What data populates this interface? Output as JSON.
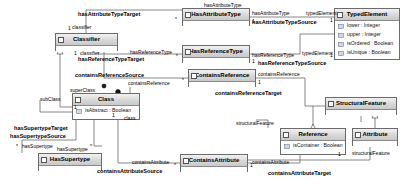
{
  "diagram": {
    "type": "uml-class-diagram",
    "background": "#ffffff",
    "node_header_color": "#d8d8d8",
    "node_border_color": "#6b6b6b"
  },
  "nodes": [
    {
      "id": "hasAttributeType",
      "name": "HasAttributeType",
      "attributes": [],
      "x": 182,
      "y": 8,
      "w": 68,
      "h": 18
    },
    {
      "id": "typedElement",
      "name": "TypedElement",
      "attributes": [
        "lower : Integer",
        "upper : Integer",
        "isOrdered : Boolean",
        "isUnique : Boolean"
      ],
      "x": 334,
      "y": 8,
      "w": 66,
      "h": 52
    },
    {
      "id": "classifier",
      "name": "Classifier",
      "attributes": [],
      "x": 55,
      "y": 33,
      "w": 63,
      "h": 18
    },
    {
      "id": "hasReferenceType",
      "name": "HasReferenceType",
      "attributes": [],
      "x": 182,
      "y": 45,
      "w": 68,
      "h": 18
    },
    {
      "id": "containsReference",
      "name": "ContainsReference",
      "attributes": [],
      "x": 188,
      "y": 69,
      "w": 68,
      "h": 18
    },
    {
      "id": "class",
      "name": "Class",
      "attributes": [
        "isAbstract : Boolean"
      ],
      "x": 72,
      "y": 93,
      "w": 68,
      "h": 27
    },
    {
      "id": "structuralFeature",
      "name": "StructuralFeature",
      "attributes": [],
      "x": 325,
      "y": 97,
      "w": 72,
      "h": 18
    },
    {
      "id": "reference",
      "name": "Reference",
      "attributes": [
        "isContainer : Boolean"
      ],
      "x": 280,
      "y": 128,
      "w": 66,
      "h": 27
    },
    {
      "id": "attribute",
      "name": "Attribute",
      "attributes": [],
      "x": 352,
      "y": 128,
      "w": 46,
      "h": 18
    },
    {
      "id": "containsAttribute",
      "name": "ContainsAttribute",
      "attributes": [],
      "x": 180,
      "y": 154,
      "w": 68,
      "h": 18
    },
    {
      "id": "hasSupertype",
      "name": "HasSupertype",
      "attributes": [],
      "x": 38,
      "y": 153,
      "w": 64,
      "h": 18
    }
  ],
  "edge_labels": [
    {
      "id": "l1",
      "text": "hasAttributeType",
      "style": "role",
      "x": 204,
      "y": 2
    },
    {
      "id": "l2",
      "text": "hasAttributeTypeTarget",
      "style": "edge",
      "x": 78,
      "y": 11
    },
    {
      "id": "l3",
      "text": "hasAttributeType",
      "style": "role",
      "x": 252,
      "y": 10
    },
    {
      "id": "l4",
      "text": "typedElement",
      "style": "role",
      "x": 306,
      "y": 10
    },
    {
      "id": "l5",
      "text": "hasAttributeTypeSource",
      "style": "edge",
      "x": 252,
      "y": 19
    },
    {
      "id": "l6",
      "text": "classifier",
      "style": "role",
      "x": 72,
      "y": 24
    },
    {
      "id": "l7",
      "text": "classifier",
      "style": "role",
      "x": 80,
      "y": 50
    },
    {
      "id": "l8",
      "text": "hasReferenceType",
      "style": "role",
      "x": 130,
      "y": 49
    },
    {
      "id": "l9",
      "text": "hasReferenceTypeTarget",
      "style": "edge",
      "x": 78,
      "y": 56
    },
    {
      "id": "l10",
      "text": "hasReferenceType",
      "style": "role",
      "x": 252,
      "y": 52
    },
    {
      "id": "l11",
      "text": "typedElement",
      "style": "role",
      "x": 302,
      "y": 50
    },
    {
      "id": "l12",
      "text": "hasReferenceTypeSource",
      "style": "edge",
      "x": 258,
      "y": 60
    },
    {
      "id": "l13",
      "text": "containsReferenceSource",
      "style": "edge",
      "x": 75,
      "y": 72
    },
    {
      "id": "l14",
      "text": "containsReference",
      "style": "role",
      "x": 128,
      "y": 80
    },
    {
      "id": "l15",
      "text": "containsReference",
      "style": "role",
      "x": 258,
      "y": 71
    },
    {
      "id": "l16",
      "text": "containsReferenceTarget",
      "style": "edge",
      "x": 215,
      "y": 90
    },
    {
      "id": "l17",
      "text": "superClass",
      "style": "role",
      "x": 70,
      "y": 87
    },
    {
      "id": "l18",
      "text": "subClass",
      "style": "role",
      "x": 40,
      "y": 96
    },
    {
      "id": "l19",
      "text": "class",
      "style": "role",
      "x": 124,
      "y": 115
    },
    {
      "id": "l20",
      "text": "hasSupertypeTarget",
      "style": "edge",
      "x": 14,
      "y": 125
    },
    {
      "id": "l21",
      "text": "hasSupertypeSource",
      "style": "edge",
      "x": 10,
      "y": 133
    },
    {
      "id": "l22",
      "text": "hasSupertype",
      "style": "role",
      "x": 22,
      "y": 143
    },
    {
      "id": "l23",
      "text": "hasSupertype",
      "style": "role",
      "x": 57,
      "y": 146
    },
    {
      "id": "l24",
      "text": "structuralFeature",
      "style": "role",
      "x": 236,
      "y": 120
    },
    {
      "id": "l25",
      "text": "structuralFeature",
      "style": "role",
      "x": 360,
      "y": 150
    },
    {
      "id": "l26",
      "text": "containsAttribute",
      "style": "role",
      "x": 132,
      "y": 159
    },
    {
      "id": "l27",
      "text": "containsAttributeSource",
      "style": "edge",
      "x": 97,
      "y": 168
    },
    {
      "id": "l28",
      "text": "containsAttribute",
      "style": "role",
      "x": 252,
      "y": 159
    },
    {
      "id": "l29",
      "text": "containsAttributeTarget",
      "style": "edge",
      "x": 272,
      "y": 170
    }
  ],
  "multiplicities": [
    {
      "id": "m1",
      "text": "1",
      "x": 68,
      "y": 25
    },
    {
      "id": "m2",
      "text": "*",
      "x": 175,
      "y": 16
    },
    {
      "id": "m3",
      "text": "1",
      "x": 252,
      "y": 18
    },
    {
      "id": "m4",
      "text": "1",
      "x": 330,
      "y": 17
    },
    {
      "id": "m5",
      "text": "1",
      "x": 74,
      "y": 50
    },
    {
      "id": "m6",
      "text": "*",
      "x": 176,
      "y": 53
    },
    {
      "id": "m7",
      "text": "1",
      "x": 252,
      "y": 58
    },
    {
      "id": "m8",
      "text": "1",
      "x": 330,
      "y": 52
    },
    {
      "id": "m9",
      "text": "*",
      "x": 182,
      "y": 77
    },
    {
      "id": "m10",
      "text": "1",
      "x": 258,
      "y": 79
    },
    {
      "id": "m11",
      "text": "1",
      "x": 74,
      "y": 104
    },
    {
      "id": "m12",
      "text": "1",
      "x": 112,
      "y": 112
    },
    {
      "id": "m13",
      "text": "*",
      "x": 16,
      "y": 143
    },
    {
      "id": "m14",
      "text": "*",
      "x": 90,
      "y": 143
    },
    {
      "id": "m15",
      "text": "1",
      "x": 338,
      "y": 151
    },
    {
      "id": "m16",
      "text": "*",
      "x": 174,
      "y": 162
    },
    {
      "id": "m17",
      "text": "1",
      "x": 250,
      "y": 162
    }
  ]
}
